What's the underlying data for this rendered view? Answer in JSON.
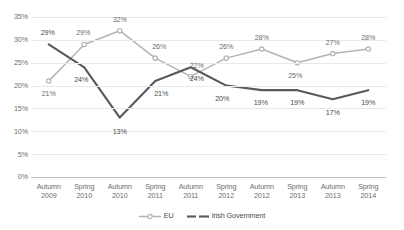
{
  "chart_data": {
    "type": "line",
    "title": "",
    "xlabel": "",
    "ylabel": "",
    "ylim": [
      0,
      35
    ],
    "ytick_step": 5,
    "grid": true,
    "legend_position": "bottom",
    "categories": [
      "Autumn 2009",
      "Spring 2010",
      "Autumn 2010",
      "Spring 2011",
      "Autumn 2011",
      "Spring 2012",
      "Autumn 2012",
      "Spring 2013",
      "Autumn 2013",
      "Spring 2014"
    ],
    "category_lines": [
      [
        "Autumn",
        "2009"
      ],
      [
        "Spring",
        "2010"
      ],
      [
        "Autumn",
        "2010"
      ],
      [
        "Spring",
        "2011"
      ],
      [
        "Autumn",
        "2011"
      ],
      [
        "Spring",
        "2012"
      ],
      [
        "Autumn",
        "2012"
      ],
      [
        "Spring",
        "2013"
      ],
      [
        "Autumn",
        "2013"
      ],
      [
        "Spring",
        "2014"
      ]
    ],
    "ytick_labels": [
      "0%",
      "5%",
      "10%",
      "15%",
      "20%",
      "25%",
      "30%",
      "35%"
    ],
    "ytick_values": [
      0,
      5,
      10,
      15,
      20,
      25,
      30,
      35
    ],
    "series": [
      {
        "name": "EU",
        "color": "#b3b3b3",
        "marker": "circle",
        "values": [
          21,
          29,
          32,
          26,
          22,
          26,
          28,
          25,
          27,
          28
        ],
        "labels": [
          "21%",
          "29%",
          "32%",
          "26%",
          "22%",
          "26%",
          "28%",
          "25%",
          "27%",
          "28%"
        ]
      },
      {
        "name": "Irish Government",
        "color": "#595959",
        "marker": "none",
        "values": [
          29,
          24,
          13,
          21,
          24,
          20,
          19,
          19,
          17,
          19
        ],
        "labels": [
          "29%",
          "24%",
          "13%",
          "21%",
          "24%",
          "20%",
          "19%",
          "19%",
          "17%",
          "19%"
        ]
      }
    ]
  },
  "legend": {
    "items": [
      {
        "label": "EU",
        "color": "#b3b3b3",
        "marker": "circle"
      },
      {
        "label": "Irish Government",
        "color": "#595959",
        "marker": "none"
      }
    ]
  }
}
